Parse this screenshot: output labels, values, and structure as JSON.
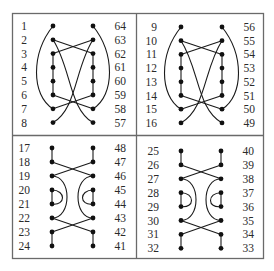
{
  "figure": {
    "colors": {
      "border": "#6a6a6a",
      "wire": "#1a1a1a",
      "dot": "#111111",
      "label": "#2a2a2a"
    },
    "panels": [
      {
        "id": "top-left",
        "left_labels": [
          "1",
          "2",
          "3",
          "4",
          "5",
          "6",
          "7",
          "8"
        ],
        "right_labels": [
          "64",
          "63",
          "62",
          "61",
          "60",
          "59",
          "58",
          "57"
        ],
        "style": "arcs-crossing"
      },
      {
        "id": "top-right",
        "left_labels": [
          "9",
          "10",
          "11",
          "12",
          "13",
          "14",
          "15",
          "16"
        ],
        "right_labels": [
          "56",
          "55",
          "54",
          "53",
          "52",
          "51",
          "50",
          "49"
        ],
        "style": "arcs-crossing"
      },
      {
        "id": "bottom-left",
        "left_labels": [
          "17",
          "18",
          "19",
          "20",
          "21",
          "22",
          "23",
          "24"
        ],
        "right_labels": [
          "48",
          "47",
          "46",
          "45",
          "44",
          "43",
          "42",
          "41"
        ],
        "style": "x-loops"
      },
      {
        "id": "bottom-right",
        "left_labels": [
          "25",
          "26",
          "27",
          "28",
          "29",
          "30",
          "31",
          "32"
        ],
        "right_labels": [
          "40",
          "39",
          "38",
          "37",
          "36",
          "35",
          "34",
          "33"
        ],
        "style": "x-loops"
      }
    ]
  }
}
